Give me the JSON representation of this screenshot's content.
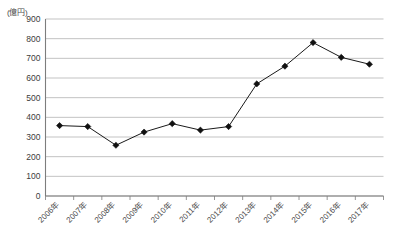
{
  "chart_data": {
    "type": "line",
    "title": "",
    "subtitle": "",
    "xlabel": "",
    "ylabel": "",
    "unit_label": "(億円)",
    "categories": [
      "2006年",
      "2007年",
      "2008年",
      "2009年",
      "2010年",
      "2011年",
      "2012年",
      "2013年",
      "2014年",
      "2015年",
      "2016年",
      "2017年"
    ],
    "values": [
      358,
      353,
      258,
      325,
      368,
      335,
      353,
      570,
      660,
      780,
      705,
      670
    ],
    "series": [
      {
        "name": "",
        "values": [
          358,
          353,
          258,
          325,
          368,
          335,
          353,
          570,
          660,
          780,
          705,
          670
        ]
      }
    ],
    "ylim": [
      0,
      900
    ],
    "ytick_values": [
      0,
      100,
      200,
      300,
      400,
      500,
      600,
      700,
      800,
      900
    ],
    "ytick_labels": [
      "0",
      "100",
      "200",
      "300",
      "400",
      "500",
      "600",
      "700",
      "800",
      "900"
    ],
    "grid": true,
    "grid_axis": "y",
    "legend": false,
    "legend_position": "none",
    "marker": "diamond",
    "line_color": "#1a1a1a",
    "marker_color": "#111111",
    "grid_color": "#b4b4b4",
    "axis_color": "#7d7d7d",
    "background_color": "#ffffff",
    "xtick_label_rotation": 45
  }
}
